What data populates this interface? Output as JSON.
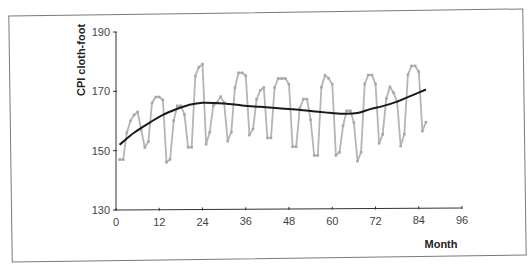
{
  "chart_data": {
    "type": "line",
    "title": "",
    "xlabel": "Month",
    "ylabel": "CPI cloth-foot",
    "xlim": [
      0,
      96
    ],
    "ylim": [
      130,
      190
    ],
    "x_ticks": [
      0,
      12,
      24,
      36,
      48,
      60,
      72,
      84,
      96
    ],
    "y_ticks": [
      130,
      150,
      170,
      190
    ],
    "grid": false,
    "legend": null,
    "series": [
      {
        "name": "CPI cloth-foot (monthly)",
        "color": "#b5b5b5",
        "markers": true,
        "x": [
          1,
          2,
          3,
          4,
          5,
          6,
          7,
          8,
          9,
          10,
          11,
          12,
          13,
          14,
          15,
          16,
          17,
          18,
          19,
          20,
          21,
          22,
          23,
          24,
          25,
          26,
          27,
          28,
          29,
          30,
          31,
          32,
          33,
          34,
          35,
          36,
          37,
          38,
          39,
          40,
          41,
          42,
          43,
          44,
          45,
          46,
          47,
          48,
          49,
          50,
          51,
          52,
          53,
          54,
          55,
          56,
          57,
          58,
          59,
          60,
          61,
          62,
          63,
          64,
          65,
          66,
          67,
          68,
          69,
          70,
          71,
          72,
          73,
          74,
          75,
          76,
          77,
          78,
          79,
          80,
          81,
          82,
          83,
          84,
          85,
          86
        ],
        "values": [
          147,
          147,
          156,
          160,
          162,
          163,
          157,
          151,
          153,
          166,
          168,
          168,
          167,
          146,
          147,
          160,
          165,
          165,
          162,
          151,
          151,
          175,
          178,
          179,
          152,
          156,
          165,
          166,
          168,
          166,
          153,
          156,
          171,
          176,
          176,
          175,
          155,
          157,
          167,
          170,
          171,
          154,
          154,
          171,
          174,
          174,
          174,
          172,
          151,
          151,
          164,
          167,
          167,
          160,
          148,
          148,
          171,
          175,
          174,
          172,
          148,
          149,
          158,
          163,
          163,
          159,
          146,
          149,
          172,
          175,
          175,
          172,
          152,
          155,
          167,
          171,
          169,
          166,
          151,
          155,
          175,
          178,
          178,
          176,
          156,
          159
        ]
      },
      {
        "name": "Trend",
        "color": "#1a1a1a",
        "markers": false,
        "x": [
          1,
          5,
          9.5,
          13,
          17,
          20,
          24,
          30,
          35,
          40,
          45,
          50,
          54,
          58,
          63,
          67,
          70.5,
          74,
          78,
          82,
          86
        ],
        "values": [
          152,
          156,
          159.5,
          162,
          164,
          165.2,
          166,
          165.7,
          165,
          164.5,
          164,
          163.5,
          163,
          162.5,
          162,
          162.2,
          163.5,
          164.5,
          166,
          168,
          170
        ]
      }
    ]
  },
  "axes": {
    "y_tick_labels": [
      "190",
      "170",
      "150",
      "130"
    ],
    "x_tick_labels": [
      "0",
      "12",
      "24",
      "36",
      "48",
      "60",
      "72",
      "84",
      "96"
    ],
    "y_title": "CPI cloth-foot",
    "x_title": "Month"
  }
}
